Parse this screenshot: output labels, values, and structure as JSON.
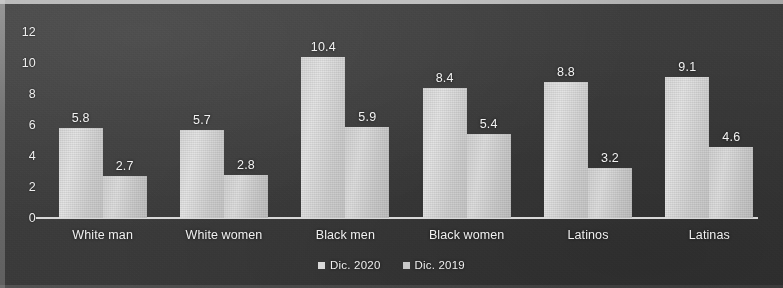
{
  "chart_data": {
    "type": "bar",
    "title": "",
    "subtitle": "",
    "xlabel": "",
    "ylabel": "",
    "categories": [
      "White man",
      "White women",
      "Black men",
      "Black women",
      "Latinos",
      "Latinas"
    ],
    "series": [
      {
        "name": "Dic. 2020",
        "values": [
          5.8,
          5.7,
          10.4,
          8.4,
          8.8,
          9.1
        ],
        "color": "#d8d8d8"
      },
      {
        "name": "Dic. 2019",
        "values": [
          2.7,
          2.8,
          5.9,
          5.4,
          3.2,
          4.6
        ],
        "color": "#c9c9c9"
      }
    ],
    "ylim": [
      0,
      12
    ],
    "yticks": [
      "0",
      "2",
      "4",
      "6",
      "8",
      "10",
      "12"
    ],
    "ytick_values": [
      0,
      2,
      4,
      6,
      8,
      10,
      12
    ],
    "grid": false,
    "legend_position": "bottom",
    "data_labels": true,
    "background_color": "#3a3a3a",
    "text_color": "#f0f0f0",
    "axis_color": "#e6e6e6"
  }
}
